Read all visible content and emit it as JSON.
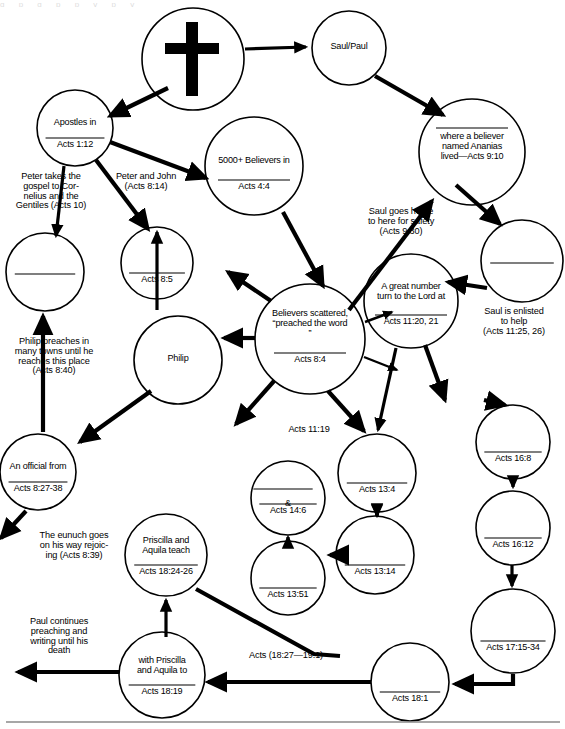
{
  "document": {
    "type": "flow-diagram",
    "title_fragment_top": "g p g p p y p y",
    "footer_rule": true
  },
  "nodes": [
    {
      "id": "cross",
      "icon": "cross-icon",
      "lines": "",
      "ref": "",
      "cx": 193,
      "cy": 59,
      "r": 51
    },
    {
      "id": "saulpaul",
      "lines": "Saul/Paul",
      "ref": "",
      "cx": 349,
      "cy": 48,
      "r": 37
    },
    {
      "id": "apostles",
      "lines": "Apostles in",
      "ref": "Acts 1:12",
      "cx": 75,
      "cy": 128,
      "r": 38
    },
    {
      "id": "believers5000",
      "lines": "5000+ Believers in",
      "ref": "Acts 4:4",
      "cx": 254,
      "cy": 166,
      "r": 49
    },
    {
      "id": "ananias",
      "lines": "where a believer\nnamed Ananias\nlived—Acts 9:10",
      "ref": "",
      "cx": 472,
      "cy": 152,
      "r": 53
    },
    {
      "id": "samaria",
      "lines": "",
      "ref": "Acts 8:5",
      "cx": 157,
      "cy": 263,
      "r": 36
    },
    {
      "id": "cornelius",
      "lines": "",
      "ref": "",
      "cx": 45,
      "cy": 272,
      "r": 39
    },
    {
      "id": "tarsus",
      "lines": "",
      "ref": "",
      "cx": 522,
      "cy": 261,
      "r": 41
    },
    {
      "id": "antioch",
      "lines": "A  great number\nturn to the Lord at",
      "ref": "Acts 11:20, 21",
      "cx": 411,
      "cy": 301,
      "r": 47
    },
    {
      "id": "scattered",
      "lines": "Believers scattered,\n“preached the word\n”",
      "ref": "Acts 8:4",
      "cx": 310,
      "cy": 339,
      "r": 55
    },
    {
      "id": "philip",
      "lines": "Philip",
      "ref": "",
      "cx": 178,
      "cy": 360,
      "r": 44
    },
    {
      "id": "gaza",
      "lines": "An official from",
      "ref": "Acts 8:27-38",
      "cx": 38,
      "cy": 472,
      "r": 38
    },
    {
      "id": "cyprus",
      "lines": "",
      "ref": "Acts 13:4",
      "cx": 377,
      "cy": 473,
      "r": 39
    },
    {
      "id": "derbe",
      "lines": "&",
      "ref": "Acts 14:6",
      "cx": 288,
      "cy": 498,
      "r": 37
    },
    {
      "id": "troas",
      "lines": "",
      "ref": "Acts 16:8",
      "cx": 513,
      "cy": 442,
      "r": 37
    },
    {
      "id": "antiochpis",
      "lines": "",
      "ref": "Acts 13:14",
      "cx": 375,
      "cy": 555,
      "r": 39
    },
    {
      "id": "iconium",
      "lines": "",
      "ref": "Acts 13:51",
      "cx": 288,
      "cy": 578,
      "r": 37
    },
    {
      "id": "philippi",
      "lines": "",
      "ref": "Acts 16:12",
      "cx": 513,
      "cy": 528,
      "r": 37
    },
    {
      "id": "priscilla",
      "lines": "Priscilla and\nAquila teach",
      "ref": "Acts 18:24-26",
      "cx": 166,
      "cy": 555,
      "r": 41
    },
    {
      "id": "athens",
      "lines": "",
      "ref": "Acts 17:15-34",
      "cx": 513,
      "cy": 631,
      "r": 42
    },
    {
      "id": "ephesus",
      "lines": "with Priscilla\nand Aquila to",
      "ref": "Acts 18:19",
      "cx": 162,
      "cy": 675,
      "r": 43
    },
    {
      "id": "corinth",
      "lines": "",
      "ref": "Acts 18:1",
      "cx": 410,
      "cy": 682,
      "r": 39
    }
  ],
  "edge_labels": [
    {
      "id": "peter-cornelius",
      "text": "Peter takes the\ngospel to Cor-\nnelius and the\nGentiles (Acts 10)",
      "x": 3,
      "y": 172,
      "w": 96
    },
    {
      "id": "peter-john",
      "text": "Peter and John\n(Acts 8:14)",
      "x": 104,
      "y": 172,
      "w": 84
    },
    {
      "id": "saul-home",
      "text": "Saul goes home\nto here for safety\n(Acts 9:30)",
      "x": 355,
      "y": 207,
      "w": 92
    },
    {
      "id": "saul-enlisted",
      "text": "Saul is enlisted\nto help\n(Acts 11:25, 26)",
      "x": 468,
      "y": 307,
      "w": 92
    },
    {
      "id": "philip-preaches",
      "text": "Philip preaches in\nmany towns until he\nreaches this place\n(Acts 8:40)",
      "x": 2,
      "y": 337,
      "w": 104
    },
    {
      "id": "acts-11-19",
      "text": "Acts 11:19",
      "x": 277,
      "y": 425,
      "w": 64
    },
    {
      "id": "eunuch",
      "text": "The eunuch goes\non his way rejoic-\ning (Acts 8:39)",
      "x": 26,
      "y": 531,
      "w": 96
    },
    {
      "id": "paul-death",
      "text": "Paul continues\npreaching and\nwriting until his\ndeath",
      "x": 13,
      "y": 617,
      "w": 92
    },
    {
      "id": "acts-18-27",
      "text": "Acts (18:27—19:1)",
      "x": 236,
      "y": 651,
      "w": 100
    }
  ],
  "colors": {
    "stroke": "#000000",
    "fill": "#ffffff",
    "footer_rule": "#8a8a8a"
  }
}
